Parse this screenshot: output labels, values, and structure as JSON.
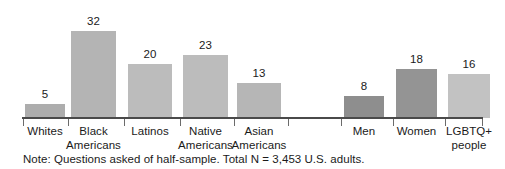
{
  "chart_data": {
    "type": "bar",
    "title": "",
    "subtitle": "",
    "xlabel": "",
    "ylabel": "",
    "ylim": [
      0,
      36
    ],
    "grid": false,
    "legend": null,
    "categories": [
      "Whites",
      "Black Americans",
      "Latinos",
      "Native Americans",
      "Asian Americans",
      "Men",
      "Women",
      "LGBTQ+ people"
    ],
    "values": [
      5,
      32,
      20,
      23,
      13,
      8,
      18,
      16
    ],
    "groups": [
      {
        "name": "race-ethnicity",
        "categories": [
          "Whites",
          "Black Americans",
          "Latinos",
          "Native Americans",
          "Asian Americans"
        ]
      },
      {
        "name": "gender-identity",
        "categories": [
          "Men",
          "Women",
          "LGBTQ+ people"
        ]
      }
    ],
    "annotations": [
      "Note: Questions asked of half-sample. Total N = 3,453 U.S. adults."
    ]
  },
  "bars": [
    {
      "id": "whites",
      "value": 5,
      "value_text": "5",
      "label_line1": "Whites",
      "label_line2": "",
      "color": "#adadad"
    },
    {
      "id": "black-americans",
      "value": 32,
      "value_text": "32",
      "label_line1": "Black",
      "label_line2": "Americans",
      "color": "#b4b4b4"
    },
    {
      "id": "latinos",
      "value": 20,
      "value_text": "20",
      "label_line1": "Latinos",
      "label_line2": "",
      "color": "#bcbcbc"
    },
    {
      "id": "native-americans",
      "value": 23,
      "value_text": "23",
      "label_line1": "Native",
      "label_line2": "Americans",
      "color": "#bcbcbc"
    },
    {
      "id": "asian-americans",
      "value": 13,
      "value_text": "13",
      "label_line1": "Asian",
      "label_line2": "Americans",
      "color": "#b6b6b6"
    },
    {
      "id": "men",
      "value": 8,
      "value_text": "8",
      "label_line1": "Men",
      "label_line2": "",
      "color": "#8e8e8e"
    },
    {
      "id": "women",
      "value": 18,
      "value_text": "18",
      "label_line1": "Women",
      "label_line2": "",
      "color": "#949494"
    },
    {
      "id": "lgbtq-people",
      "value": 16,
      "value_text": "16",
      "label_line1": "LGBTQ+",
      "label_line2": "people",
      "color": "#c2c2c2"
    }
  ],
  "note": {
    "text": "Note: Questions asked of half-sample. Total N = 3,453 U.S. adults."
  },
  "axis": {
    "color": "#4a4a4a",
    "tick_color": "#6b6b6b"
  },
  "layout": {
    "bar_left": [
      25,
      71,
      128,
      183,
      237,
      344,
      396,
      448
    ],
    "bar_width": [
      40,
      45,
      44,
      45,
      44,
      40,
      41,
      42
    ],
    "tick_x": [
      23,
      68,
      124,
      180,
      234,
      288,
      341,
      393,
      445,
      482
    ],
    "baseline_y": 117,
    "px_per_unit": 2.72
  }
}
